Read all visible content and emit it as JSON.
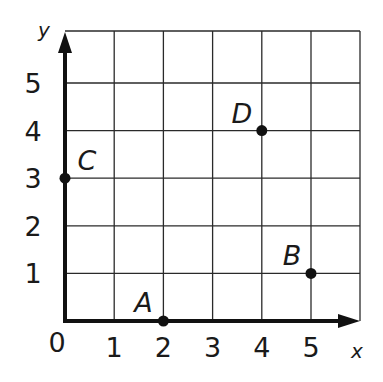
{
  "chart_data": {
    "type": "scatter",
    "title": "",
    "xlabel": "x",
    "ylabel": "y",
    "xlim": [
      0,
      6
    ],
    "ylim": [
      0,
      6
    ],
    "grid": true,
    "x_ticks": [
      "0",
      "1",
      "2",
      "3",
      "4",
      "5"
    ],
    "y_ticks": [
      "1",
      "2",
      "3",
      "4",
      "5"
    ],
    "points": [
      {
        "label": "A",
        "x": 2,
        "y": 0
      },
      {
        "label": "B",
        "x": 5,
        "y": 1
      },
      {
        "label": "C",
        "x": 0,
        "y": 3
      },
      {
        "label": "D",
        "x": 4,
        "y": 4
      }
    ]
  },
  "colors": {
    "grid": "#2a2a2a",
    "axis": "#111111",
    "point": "#111111",
    "background": "#ffffff"
  }
}
